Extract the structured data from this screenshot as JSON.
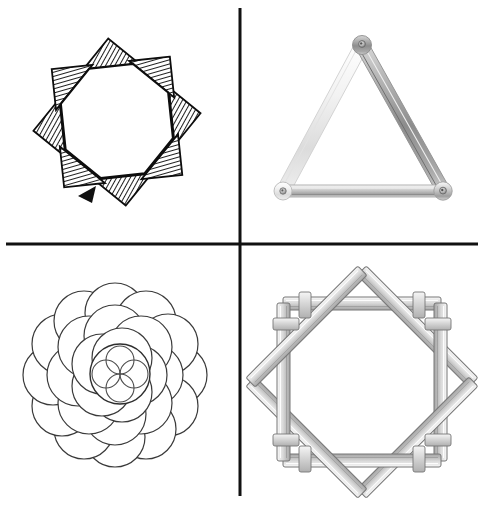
{
  "plate": {
    "title": "Geometric figure plate",
    "width": 490,
    "height": 512,
    "background_color": "#ffffff",
    "divider": {
      "name": "quadrant-divider-cross",
      "color": "#111111",
      "vertical_x": 240,
      "vertical_y_start": 8,
      "vertical_y_end": 496,
      "horizontal_y": 244,
      "horizontal_x_start": 6,
      "horizontal_x_end": 478,
      "stroke_width": 3
    },
    "panel_count": 4
  },
  "panels": [
    {
      "id": "top-left",
      "label": "Eight-pointed hatched star",
      "figure": "octagram",
      "description": "Eight pointed star formed by two overlapping squares rotated forty-five degrees, points filled with diagonal cross hatching",
      "center_x": 117,
      "center_y": 122,
      "outer_radius": 82,
      "inner_radius": 56,
      "point_count": 8,
      "outline_color": "#0d0d0d",
      "hatch_color": "#2b2b2b",
      "fill_color": "#ffffff",
      "stroke_width": 2.2
    },
    {
      "id": "top-right",
      "label": "Bolted metal bar triangle",
      "figure": "triangle-of-bars",
      "description": "Equilateral triangle built from three flat metal bars riveted together at the three corners",
      "apex_x": 362,
      "apex_y": 45,
      "left_x": 283,
      "left_y": 191,
      "right_x": 443,
      "right_y": 191,
      "bar_count": 3,
      "bar_width": 11,
      "bolt_count": 3,
      "bar_color_light": "#efefef",
      "bar_color_mid": "#bdbdbd",
      "bar_color_dark": "#8a8a8a",
      "outline_color": "#9a9a9a"
    },
    {
      "id": "bottom-left",
      "label": "Overlapping circle rosette",
      "figure": "circle-cluster",
      "description": "Dense cluster of overlapping outlined circles arranged in rings around a small quatrefoil flower",
      "center_x": 115,
      "center_y": 375,
      "cluster_radius": 90,
      "circle_count": 25,
      "ring_counts": [
        1,
        6,
        12,
        6
      ],
      "outline_color": "#3a3a3a",
      "fill_color": "#ffffff",
      "stroke_width": 1.2,
      "flower": {
        "name": "quatrefoil-flower",
        "center_x": 120,
        "center_y": 374,
        "radius": 30,
        "petal_count": 4
      }
    },
    {
      "id": "bottom-right",
      "label": "Interlocked wooden stick octagon",
      "figure": "stick-octagon",
      "description": "Eight wooden beams laid in an octagonal ring, each crossing over the next with protruding ends",
      "center_x": 362,
      "center_y": 382,
      "ring_radius": 78,
      "stick_count": 8,
      "stick_width": 13,
      "overhang": 26,
      "wood_color_light": "#f2f2f2",
      "wood_color_mid": "#cfcfcf",
      "wood_color_dark": "#8f8f8f",
      "outline_color": "#767676"
    }
  ]
}
